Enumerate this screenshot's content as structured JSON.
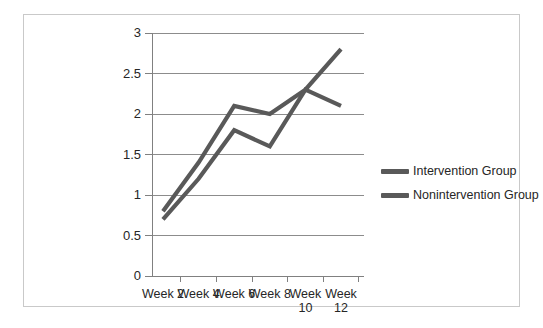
{
  "chart_data": {
    "type": "line",
    "title": "",
    "xlabel": "",
    "ylabel": "",
    "categories": [
      "Week 2",
      "Week 4",
      "Week 6",
      "Week 8",
      "Week 10",
      "Week 12"
    ],
    "ylim": [
      0,
      3
    ],
    "yticks": [
      "0",
      "0.5",
      "1",
      "1.5",
      "2",
      "2.5",
      "3"
    ],
    "ytick_values": [
      0,
      0.5,
      1,
      1.5,
      2,
      2.5,
      3
    ],
    "grid": true,
    "legend_position": "right",
    "series": [
      {
        "name": "Intervention Group",
        "color": "#595959",
        "values": [
          0.8,
          1.4,
          2.1,
          2.0,
          2.3,
          2.8
        ]
      },
      {
        "name": "Nonintervention Group",
        "color": "#595959",
        "values": [
          0.7,
          1.2,
          1.8,
          1.6,
          2.3,
          2.1
        ]
      }
    ]
  },
  "legend": {
    "items": [
      {
        "label": "Intervention Group"
      },
      {
        "label": "Nonintervention Group"
      }
    ]
  },
  "colors": {
    "line": "#595959",
    "grid": "#8c8c8c",
    "axis": "#808080",
    "frame": "#c9c9c9",
    "text": "#262626"
  }
}
